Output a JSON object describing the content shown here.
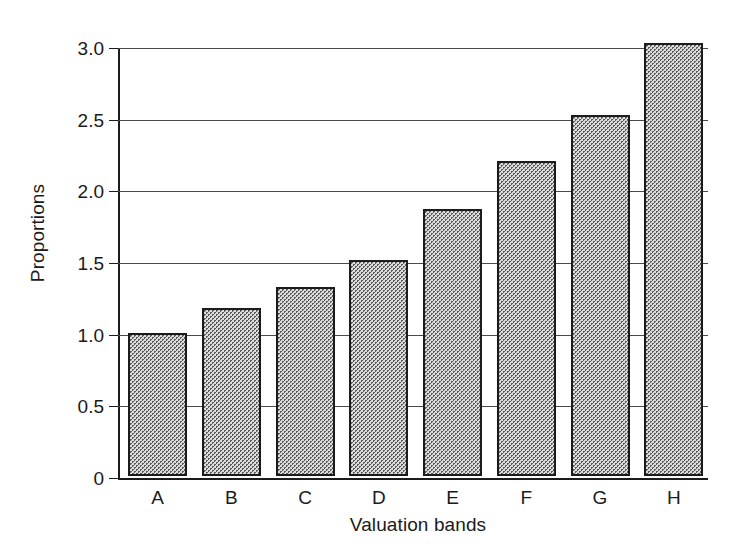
{
  "chart_data": {
    "type": "bar",
    "title": "",
    "subtitle": "",
    "xlabel": "Valuation bands",
    "ylabel": "Proportions",
    "categories": [
      "A",
      "B",
      "C",
      "D",
      "E",
      "F",
      "G",
      "H"
    ],
    "values": [
      1.0,
      1.17,
      1.32,
      1.51,
      1.86,
      2.2,
      2.52,
      3.02
    ],
    "series": [
      {
        "name": "Proportions",
        "values": [
          1.0,
          1.17,
          1.32,
          1.51,
          1.86,
          2.2,
          2.52,
          3.02
        ]
      }
    ],
    "ylim": [
      0,
      3.0
    ],
    "yticks": [
      0,
      0.5,
      1.0,
      1.5,
      2.0,
      2.5,
      3.0
    ],
    "ytick_labels": [
      "0",
      "0.5",
      "1.0",
      "1.5",
      "2.0",
      "2.5",
      "3.0"
    ],
    "grid": true,
    "grid_axis": "y",
    "legend": false,
    "legend_position": "none",
    "annotations": [],
    "bar_fill": "#dcdcdc",
    "bar_edge": "#1b1b1b",
    "axis_color": "#1b1b1b",
    "grid_color": "#4a4a4a",
    "background": "#ffffff"
  }
}
